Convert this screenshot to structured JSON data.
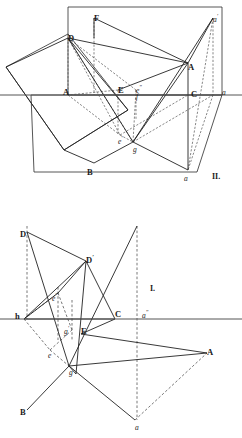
{
  "figure": {
    "title_hidden": "",
    "stroke_color": "#2b2b2b",
    "background_color": "#ffffff",
    "width": 242,
    "height": 438,
    "panels": [
      {
        "id": "upper",
        "name": "pictorial-view",
        "roman_label": "II."
      },
      {
        "id": "lower",
        "name": "orthographic-view",
        "roman_label": "I."
      }
    ]
  },
  "upper_labels": [
    {
      "name": "point-label-F",
      "text": "F",
      "x": 94,
      "y": 14,
      "style": "cap"
    },
    {
      "name": "point-label-D",
      "text": "D",
      "x": 68,
      "y": 34,
      "style": "cap"
    },
    {
      "name": "point-label-a-prime",
      "text": "a",
      "prime": "′",
      "x": 213,
      "y": 13,
      "style": "low"
    },
    {
      "name": "point-label-A-upper",
      "text": "A",
      "x": 188,
      "y": 63,
      "style": "cap"
    },
    {
      "name": "point-label-A-ground",
      "text": "A",
      "x": 63,
      "y": 88,
      "style": "cap"
    },
    {
      "name": "point-label-E",
      "text": "E",
      "x": 118,
      "y": 86,
      "style": "cap"
    },
    {
      "name": "point-label-C",
      "text": "C",
      "x": 191,
      "y": 90,
      "style": "cap"
    },
    {
      "name": "point-label-a-ground",
      "text": "a",
      "x": 222,
      "y": 89,
      "style": "low"
    },
    {
      "name": "point-label-e-dprime",
      "text": "e",
      "prime": "″",
      "x": 136,
      "y": 84,
      "style": "low"
    },
    {
      "name": "point-label-f-upper",
      "text": "f",
      "x": 136,
      "y": 93,
      "style": "low"
    },
    {
      "name": "point-label-e-prime",
      "text": "e",
      "prime": "′",
      "x": 118,
      "y": 135,
      "style": "low"
    },
    {
      "name": "point-label-g-upper",
      "text": "g",
      "x": 133,
      "y": 146,
      "style": "low"
    },
    {
      "name": "point-label-B-upper",
      "text": "B",
      "x": 87,
      "y": 168,
      "style": "cap"
    },
    {
      "name": "point-label-a-lower-upper",
      "text": "a",
      "x": 184,
      "y": 175,
      "style": "low"
    },
    {
      "name": "panel-label-II",
      "text": "II.",
      "x": 212,
      "y": 173,
      "style": "roman"
    }
  ],
  "lower_labels": [
    {
      "name": "point-label-D-lower",
      "text": "D",
      "x": 20,
      "y": 230,
      "style": "cap"
    },
    {
      "name": "point-label-D-prime",
      "text": "D",
      "prime": "′",
      "x": 86,
      "y": 254,
      "style": "cap"
    },
    {
      "name": "panel-label-I",
      "text": "I.",
      "x": 150,
      "y": 285,
      "style": "roman"
    },
    {
      "name": "point-label-e-dprime-lower",
      "text": "e",
      "prime": "″",
      "x": 52,
      "y": 292,
      "style": "low"
    },
    {
      "name": "point-label-h",
      "text": "h",
      "x": 15,
      "y": 312,
      "style": "cap"
    },
    {
      "name": "point-label-g-prime",
      "text": "g",
      "prime": "′",
      "x": 64,
      "y": 325,
      "style": "low"
    },
    {
      "name": "point-label-E-lower",
      "text": "E",
      "x": 81,
      "y": 327,
      "style": "cap"
    },
    {
      "name": "point-label-C-lower",
      "text": "C",
      "x": 115,
      "y": 310,
      "style": "cap"
    },
    {
      "name": "point-label-a-dprime",
      "text": "a",
      "prime": "″",
      "x": 142,
      "y": 309,
      "style": "low"
    },
    {
      "name": "point-label-e-lower",
      "text": "e",
      "x": 48,
      "y": 352,
      "style": "low"
    },
    {
      "name": "point-label-A-lower",
      "text": "A",
      "x": 207,
      "y": 348,
      "style": "cap"
    },
    {
      "name": "point-label-g-lower",
      "text": "g",
      "x": 69,
      "y": 369,
      "style": "low"
    },
    {
      "name": "point-label-B-lower",
      "text": "B",
      "x": 20,
      "y": 408,
      "style": "cap"
    },
    {
      "name": "point-label-a-bottom",
      "text": "a",
      "x": 135,
      "y": 424,
      "style": "low"
    }
  ],
  "geometry": {
    "upper": {
      "vertical_plane_outline": "M 68,7 L 222,7 L 222,95 L 68,95 Z",
      "horizontal_plane_outline": "M 31,95 L 222,95 L 197,172 L 34,172 Z",
      "oblique_plane_outline": "M 6,67 L 68,34 L 128,110 L 64,150 Z",
      "ground_line": "M 0,95 L 242,95",
      "solid_segments": [
        "M 94,18 L 188,63",
        "M 68,38 L 188,63",
        "M 68,38 L 133,142",
        "M 188,63 L 133,142",
        "M 188,63 L 188,170",
        "M 133,142 L 188,170",
        "M 133,142 L 94,163",
        "M 94,163 L 64,150",
        "M 94,18 L 94,38",
        "M 68,38 L 6,67",
        "M 6,67 L 64,150",
        "M 64,150 L 128,110",
        "M 128,110 L 68,38",
        "M 213,18 L 188,63",
        "M 213,18 L 133,142",
        "M 118,90 L 188,63"
      ],
      "dashed_segments": [
        "M 94,18 L 94,95",
        "M 68,38 L 68,95",
        "M 213,18 L 213,95",
        "M 213,95 L 188,170",
        "M 68,38 L 136,90",
        "M 68,38 L 133,142",
        "M 68,38 L 120,135",
        "M 118,90 L 68,95",
        "M 118,90 L 118,135",
        "M 120,135 L 133,142",
        "M 136,90 L 133,142",
        "M 136,90 L 136,120",
        "M 213,18 L 188,170",
        "M 68,95 L 120,135",
        "M 120,135 L 188,95",
        "M 133,142 L 213,95"
      ]
    },
    "lower": {
      "ground_line": "M 0,319 L 242,319",
      "solid_segments": [
        "M 27,232 L 86,261",
        "M 27,232 L 69,366",
        "M 86,261 L 24,319",
        "M 86,261 L 76,374",
        "M 24,319 L 115,319",
        "M 115,319 L 86,261",
        "M 115,319 L 81,334",
        "M 81,334 L 207,353",
        "M 69,366 L 27,410",
        "M 69,366 L 207,353",
        "M 69,366 L 135,420",
        "M 69,366 L 137,226",
        "M 58,293 L 86,261",
        "M 24,319 L 58,293",
        "M 76,374 L 69,366"
      ],
      "dashed_segments": [
        "M 27,226 L 27,319",
        "M 58,287 L 58,340",
        "M 72,300 L 72,340",
        "M 137,226 L 137,420",
        "M 24,319 L 58,293",
        "M 24,319 L 50,350",
        "M 50,350 L 72,330",
        "M 58,293 L 72,330",
        "M 50,350 L 69,366",
        "M 135,420 L 207,353"
      ]
    }
  }
}
